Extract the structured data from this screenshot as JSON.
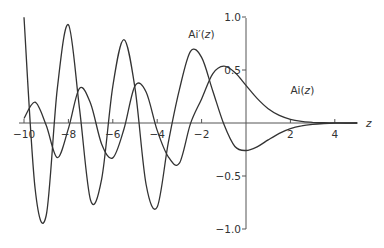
{
  "chart_data": {
    "type": "line",
    "title": "",
    "xlabel": "z",
    "ylabel": "",
    "xlim": [
      -10,
      5
    ],
    "ylim": [
      -1.0,
      1.0
    ],
    "grid": false,
    "legend": "inline labels",
    "x_ticks": [
      -10,
      -8,
      -6,
      -4,
      -2,
      2,
      4
    ],
    "x_tick_labels": [
      "−10",
      "−8",
      "−6",
      "−4",
      "−2",
      "2",
      "4"
    ],
    "y_ticks": [
      1.0,
      0.5,
      -0.5,
      -1.0
    ],
    "y_tick_labels": [
      "1.0",
      "0.5",
      "−0.5",
      "−1.0"
    ],
    "annotations": [
      {
        "text_main": "Ai",
        "text_arg": "(z)",
        "prime": false,
        "x": 2.0,
        "y": 0.27
      },
      {
        "text_main": "Ai",
        "text_arg": "(z)",
        "prime": true,
        "x": -2.6,
        "y": 0.8
      }
    ],
    "series": [
      {
        "name": "Ai(z)",
        "x": [
          -10,
          -9.5,
          -9,
          -8.5,
          -8,
          -7.5,
          -7,
          -6.5,
          -6,
          -5.5,
          -5,
          -4.5,
          -4,
          -3.5,
          -3,
          -2.5,
          -2,
          -1.5,
          -1,
          -0.5,
          0,
          0.5,
          1,
          1.5,
          2,
          2.5,
          3,
          3.5,
          4,
          4.5,
          5
        ],
        "values": [
          0.042,
          0.196,
          -0.022,
          -0.327,
          -0.053,
          0.326,
          0.184,
          -0.2,
          -0.329,
          -0.059,
          0.351,
          0.292,
          -0.07,
          -0.319,
          -0.379,
          -0.006,
          0.227,
          0.464,
          0.536,
          0.476,
          0.355,
          0.232,
          0.135,
          0.072,
          0.035,
          0.016,
          0.007,
          0.003,
          0.001,
          0.0,
          0.0
        ]
      },
      {
        "name": "Ai'(z)",
        "x": [
          -10,
          -9.5,
          -9,
          -8.5,
          -8,
          -7.5,
          -7,
          -6.5,
          -6,
          -5.5,
          -5,
          -4.5,
          -4,
          -3.5,
          -3,
          -2.5,
          -2,
          -1.5,
          -1,
          -0.5,
          0,
          0.5,
          1,
          1.5,
          2,
          2.5,
          3,
          3.5,
          4,
          4.5,
          5
        ],
        "values": [
          0.997,
          -0.618,
          -0.873,
          0.324,
          0.927,
          0.136,
          -0.729,
          -0.526,
          0.346,
          0.787,
          0.328,
          -0.58,
          -0.792,
          -0.186,
          0.315,
          0.676,
          0.619,
          0.305,
          -0.01,
          -0.222,
          -0.259,
          -0.225,
          -0.159,
          -0.097,
          -0.053,
          -0.027,
          -0.012,
          -0.005,
          -0.002,
          -0.001,
          0.0
        ]
      }
    ]
  }
}
